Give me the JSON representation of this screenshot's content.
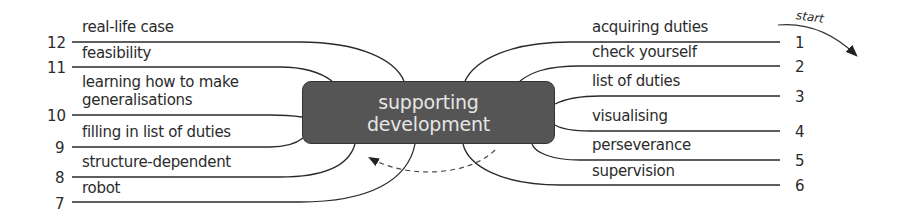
{
  "diagram": {
    "center": {
      "line1": "supporting",
      "line2": "development",
      "fill": "#555555",
      "text_color": "#e6e6e6"
    },
    "start_label": "start",
    "right_branches": [
      {
        "num": "1",
        "label": "acquiring duties"
      },
      {
        "num": "2",
        "label": "check yourself"
      },
      {
        "num": "3",
        "label": "list of duties"
      },
      {
        "num": "4",
        "label": "visualising"
      },
      {
        "num": "5",
        "label": "perseverance"
      },
      {
        "num": "6",
        "label": "supervision"
      }
    ],
    "left_branches": [
      {
        "num": "7",
        "label": "robot"
      },
      {
        "num": "8",
        "label": "structure-dependent"
      },
      {
        "num": "9",
        "label": "filling in list of duties"
      },
      {
        "num": "10",
        "label_line1": "learning how to make",
        "label_line2": "generalisations"
      },
      {
        "num": "11",
        "label": "feasibility"
      },
      {
        "num": "12",
        "label": "real-life case"
      }
    ],
    "icons": {
      "start_arrow": "curved-arrow-icon",
      "return_arrow": "dashed-arrow-icon"
    }
  }
}
